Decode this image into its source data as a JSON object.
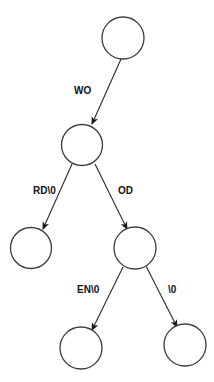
{
  "diagram": {
    "type": "tree",
    "colors": {
      "node_stroke": "#3a3a3a",
      "node_fill": "#ffffff",
      "edge": "#2a2a2a",
      "label": "#111111",
      "background": "#ffffff"
    },
    "nodes": [
      {
        "id": "n0",
        "cx": 123,
        "cy": 38,
        "r": 21
      },
      {
        "id": "n1",
        "cx": 82,
        "cy": 145,
        "r": 20.5
      },
      {
        "id": "n2",
        "cx": 31,
        "cy": 248,
        "r": 20.5
      },
      {
        "id": "n3",
        "cx": 135,
        "cy": 248,
        "r": 21
      },
      {
        "id": "n4",
        "cx": 81,
        "cy": 348,
        "r": 21
      },
      {
        "id": "n5",
        "cx": 185,
        "cy": 345,
        "r": 21
      }
    ],
    "edges": [
      {
        "from": "n0",
        "to": "n1",
        "label": "WO",
        "x1": 121,
        "y1": 59,
        "x2": 92,
        "y2": 124,
        "lx": 74,
        "ly": 94
      },
      {
        "from": "n1",
        "to": "n2",
        "label": "RD\\0",
        "x1": 72,
        "y1": 164,
        "x2": 43,
        "y2": 229,
        "lx": 33,
        "ly": 194
      },
      {
        "from": "n1",
        "to": "n3",
        "label": "OD",
        "x1": 95,
        "y1": 164,
        "x2": 127,
        "y2": 229,
        "lx": 118,
        "ly": 194
      },
      {
        "from": "n3",
        "to": "n4",
        "label": "EN\\0",
        "x1": 123,
        "y1": 267,
        "x2": 92,
        "y2": 330,
        "lx": 77,
        "ly": 293
      },
      {
        "from": "n3",
        "to": "n5",
        "label": "\\0",
        "x1": 146,
        "y1": 266,
        "x2": 177,
        "y2": 327,
        "lx": 168,
        "ly": 293
      }
    ]
  }
}
